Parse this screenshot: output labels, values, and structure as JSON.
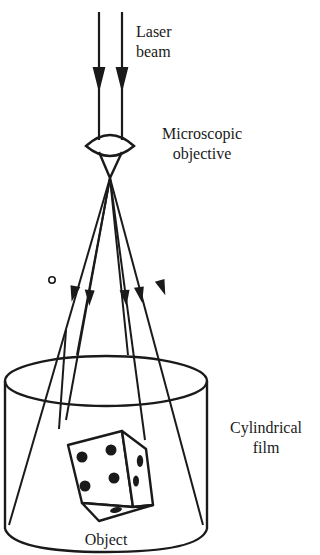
{
  "labels": {
    "laser_line1": "Laser",
    "laser_line2": "beam",
    "objective_line1": "Microscopic",
    "objective_line2": "objective",
    "film_line1": "Cylindrical",
    "film_line2": "film",
    "object": "Object"
  },
  "colors": {
    "ink": "#1a1a1a",
    "background": "#ffffff"
  },
  "components": [
    {
      "name": "laser-beam",
      "description": "Two parallel downward arrows"
    },
    {
      "name": "microscopic-objective",
      "description": "Biconvex lens focusing beam to a point"
    },
    {
      "name": "diverging-rays",
      "description": "Eight rays fanning out from focal point, six with arrowheads"
    },
    {
      "name": "cylindrical-film",
      "description": "Cylinder surrounding the object"
    },
    {
      "name": "object",
      "description": "Die showing four pips on front face, two on side, one on bottom"
    }
  ]
}
